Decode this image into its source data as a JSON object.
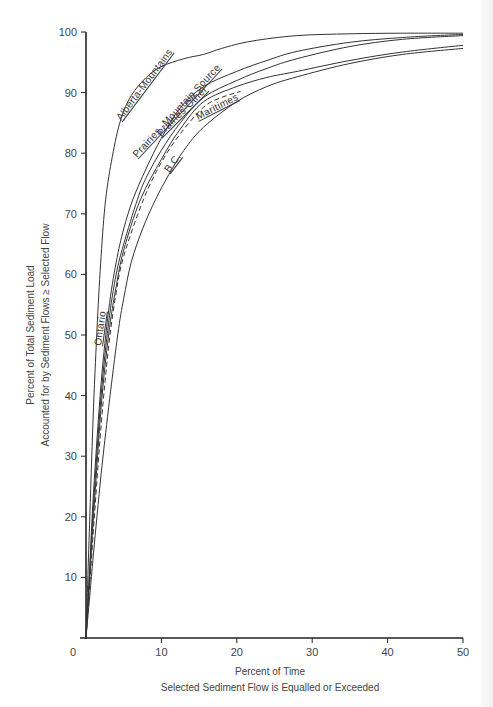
{
  "chart_data": {
    "type": "line",
    "title": "",
    "xlabel": "Percent of Time",
    "xlabel_line2": "Selected Sediment Flow is Equalled or Exceeded",
    "ylabel": "Percent of Total Sediment Load",
    "ylabel_line2": "Accounted for by Sediment Flows ≥ Selected Flow",
    "xlim": [
      0,
      50
    ],
    "ylim": [
      0,
      100
    ],
    "x_ticks": [
      0,
      10,
      20,
      30,
      40,
      50
    ],
    "y_ticks": [
      10,
      20,
      30,
      40,
      50,
      60,
      70,
      80,
      90,
      100
    ],
    "grid": false,
    "legend": "inline labels on curves",
    "series": [
      {
        "name": "Alberta-Mountains",
        "style": "solid",
        "x": [
          0,
          0.5,
          1.0,
          1.5,
          2.0,
          2.6,
          3.5,
          4.6,
          6.0,
          8.0,
          10.0,
          13.0,
          15.6,
          18.0,
          22.0,
          28.0,
          35.0,
          42.0,
          50.0
        ],
        "y": [
          0,
          20,
          38,
          52,
          63,
          72.3,
          79.5,
          85.5,
          89.5,
          92.5,
          94.3,
          95.6,
          96.3,
          97.3,
          98.5,
          99.4,
          99.7,
          99.8,
          99.8
        ]
      },
      {
        "name": "Prairies-Mountain Source",
        "style": "solid",
        "x": [
          0,
          0.5,
          1.0,
          2.0,
          3.0,
          4.0,
          5.0,
          6.2,
          8.0,
          10.0,
          12.5,
          15.6,
          20.0,
          24.0,
          28.0,
          35.0,
          42.0,
          50.0
        ],
        "y": [
          0,
          12,
          24,
          42,
          54,
          62,
          67.5,
          72.3,
          77.5,
          82.5,
          87.5,
          91.0,
          93.5,
          95.3,
          96.8,
          98.3,
          99.1,
          99.6
        ]
      },
      {
        "name": "Prairies-Other",
        "style": "solid",
        "x": [
          0,
          0.5,
          1.0,
          2.0,
          3.0,
          4.0,
          5.0,
          6.8,
          8.0,
          10.0,
          12.5,
          15.6,
          20.0,
          24.0,
          28.0,
          35.0,
          42.0,
          50.0
        ],
        "y": [
          0,
          11,
          22,
          40,
          52,
          60,
          65,
          72.3,
          76,
          80.5,
          85,
          89.2,
          92,
          94,
          95.6,
          97.6,
          98.8,
          99.4
        ]
      },
      {
        "name": "Maritimes",
        "style": "solid",
        "x": [
          0,
          0.5,
          1.0,
          2.0,
          3.0,
          4.0,
          5.0,
          7.2,
          10.0,
          12.5,
          15.6,
          20.0,
          24.0,
          28.0,
          35.0,
          42.0,
          50.0
        ],
        "y": [
          0,
          10,
          20,
          38,
          50,
          58,
          64,
          72.3,
          79,
          84,
          88.5,
          91,
          92.5,
          93.5,
          95.3,
          96.7,
          97.8
        ]
      },
      {
        "name": "Ontario",
        "style": "dashed",
        "x": [
          0,
          0.5,
          1.0,
          2.0,
          3.0,
          4.0,
          5.0,
          7.6,
          10.0,
          12.5,
          15.6,
          18.0,
          20.5
        ],
        "y": [
          0,
          9,
          18,
          35,
          48,
          57,
          63,
          72.3,
          78.5,
          83.2,
          87.6,
          89.2,
          90.2
        ]
      },
      {
        "name": "B.C.",
        "style": "solid",
        "x": [
          0,
          0.5,
          1.0,
          2.0,
          3.0,
          4.2,
          5.0,
          6.0,
          7.5,
          9.2,
          11.0,
          13.0,
          15.6,
          20.0,
          24.0,
          28.0,
          35.0,
          42.0,
          50.0
        ],
        "y": [
          0,
          7,
          14,
          27,
          38,
          50,
          56,
          62,
          67.5,
          72.3,
          76.5,
          80.5,
          84.3,
          88.5,
          91,
          92.6,
          94.8,
          96.3,
          97.3
        ]
      }
    ]
  },
  "labels": {
    "curves": [
      {
        "text": "Alberta-Mountains",
        "x": 121,
        "y": 121,
        "angle": -53
      },
      {
        "text": "Prairies -Mountain Source",
        "x": 137,
        "y": 158,
        "angle": -47
      },
      {
        "text": "Prairies-Other",
        "x": 161,
        "y": 137,
        "angle": -45
      },
      {
        "text": "Maritimes",
        "x": 198,
        "y": 120,
        "angle": -27
      },
      {
        "text": "B.C.",
        "x": 169,
        "y": 173,
        "angle": -53
      },
      {
        "text": "Ontario",
        "x": 101,
        "y": 346,
        "angle": -82
      }
    ]
  }
}
